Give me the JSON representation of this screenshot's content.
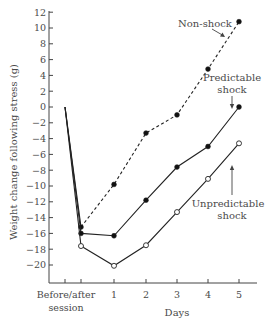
{
  "chart_data": {
    "type": "line",
    "title": "",
    "xlabel": "Days",
    "ylabel": "Weight change following stress (g)",
    "x_categories": [
      "Before",
      "After",
      "1",
      "2",
      "3",
      "4",
      "5"
    ],
    "x_tick_labels": [
      {
        "label": "Before/after",
        "sub": "session"
      },
      {
        "label": "1"
      },
      {
        "label": "2"
      },
      {
        "label": "3"
      },
      {
        "label": "4"
      },
      {
        "label": "5"
      }
    ],
    "y_ticks": [
      12,
      10,
      8,
      6,
      4,
      2,
      0,
      -2,
      -4,
      -6,
      -8,
      -10,
      -12,
      -14,
      -16,
      -18,
      -20
    ],
    "y_tick_labels": [
      "12",
      "10",
      "8",
      "6",
      "4",
      "2",
      "0",
      "−2",
      "−4",
      "−6",
      "−8",
      "−10",
      "−12",
      "−14",
      "−16",
      "−18",
      "−20"
    ],
    "ylim": [
      -22,
      12
    ],
    "grid": false,
    "legend_position": "inline annotations",
    "series": [
      {
        "name": "Non-shock",
        "label_lines": [
          "Non-shock"
        ],
        "style": "dashed",
        "marker": "filled-circle",
        "values": [
          0,
          -15.2,
          -9.8,
          -3.3,
          -1.0,
          4.8,
          10.8
        ]
      },
      {
        "name": "Predictable shock",
        "label_lines": [
          "Predictable",
          "shock"
        ],
        "style": "solid",
        "marker": "filled-circle",
        "values": [
          0,
          -16.0,
          -16.3,
          -11.8,
          -7.6,
          -5.0,
          0.0
        ]
      },
      {
        "name": "Unpredictable shock",
        "label_lines": [
          "Unpredictable",
          "shock"
        ],
        "style": "solid",
        "marker": "open-circle",
        "values": [
          0,
          -17.6,
          -20.1,
          -17.5,
          -13.3,
          -9.1,
          -4.6
        ]
      }
    ]
  }
}
